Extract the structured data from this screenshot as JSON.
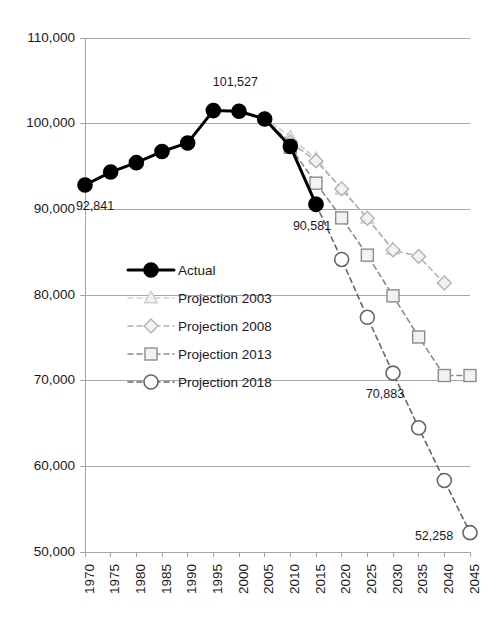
{
  "chart_data": {
    "type": "line",
    "title": "",
    "subtitle": "",
    "xlabel": "",
    "ylabel": "",
    "xlim": [
      1970,
      2045
    ],
    "ylim": [
      50000,
      110000
    ],
    "ytick_step": 10000,
    "xtick_step": 5,
    "grid": true,
    "grid_axis": "y",
    "legend_position": "inside-left",
    "xticks": [
      1970,
      1975,
      1980,
      1985,
      1990,
      1995,
      2000,
      2005,
      2010,
      2015,
      2020,
      2025,
      2030,
      2035,
      2040,
      2045
    ],
    "xtick_labels": [
      "1970",
      "1975",
      "1980",
      "1985",
      "1990",
      "1995",
      "2000",
      "2005",
      "2010",
      "2015",
      "2020",
      "2025",
      "2030",
      "2035",
      "2040",
      "2045"
    ],
    "yticks": [
      50000,
      60000,
      70000,
      80000,
      90000,
      100000,
      110000
    ],
    "ytick_labels": [
      "50,000",
      "60,000",
      "70,000",
      "80,000",
      "90,000",
      "100,000",
      "110,000"
    ],
    "series": [
      {
        "name": "Actual",
        "marker": "circle-filled",
        "line": "solid",
        "color": "#000000",
        "marker_fill": "#000000",
        "line_width": 3,
        "marker_size": 7,
        "x": [
          1970,
          1975,
          1980,
          1985,
          1990,
          1995,
          2000,
          2005,
          2010,
          2015
        ],
        "values": [
          92841,
          94350,
          95450,
          96750,
          97750,
          101527,
          101450,
          100550,
          97350,
          90581
        ]
      },
      {
        "name": "Projection 2003",
        "marker": "triangle-open",
        "line": "dashed",
        "color": "#cfcfcf",
        "marker_fill": "#f2f2f2",
        "line_width": 1.6,
        "marker_size": 6,
        "x": [
          2000,
          2005,
          2010,
          2015,
          2020,
          2025,
          2030
        ],
        "values": [
          101527,
          100700,
          98450,
          95900,
          92350,
          88950,
          85350
        ]
      },
      {
        "name": "Projection 2008",
        "marker": "diamond-open",
        "line": "dashed",
        "color": "#b3b3b3",
        "marker_fill": "#f2f2f2",
        "line_width": 1.6,
        "marker_size": 6,
        "x": [
          2005,
          2010,
          2015,
          2020,
          2025,
          2030,
          2035,
          2040
        ],
        "values": [
          100550,
          97850,
          95650,
          92400,
          88950,
          85250,
          84500,
          81400
        ]
      },
      {
        "name": "Projection 2013",
        "marker": "square-open",
        "line": "dashed",
        "color": "#8c8c8c",
        "marker_fill": "#f2f2f2",
        "line_width": 1.6,
        "marker_size": 6,
        "x": [
          2010,
          2015,
          2020,
          2025,
          2030,
          2035,
          2040,
          2045
        ],
        "values": [
          97250,
          93050,
          89000,
          84650,
          79900,
          75100,
          70600,
          70600
        ]
      },
      {
        "name": "Projection 2018",
        "marker": "circle-open",
        "line": "dashed",
        "color": "#666666",
        "marker_fill": "#ffffff",
        "line_width": 1.6,
        "marker_size": 7,
        "x": [
          2015,
          2020,
          2025,
          2030,
          2035,
          2040,
          2045
        ],
        "values": [
          90581,
          84150,
          77400,
          70883,
          64500,
          58350,
          52258
        ]
      }
    ],
    "annotations": [
      {
        "text": "92,841",
        "x": 1970,
        "y": 92841,
        "dx": 10,
        "dy": 22
      },
      {
        "text": "101,527",
        "x": 1995,
        "y": 101527,
        "dx": 22,
        "dy": -28
      },
      {
        "text": "90,581",
        "x": 2015,
        "y": 90581,
        "dx": -4,
        "dy": 22
      },
      {
        "text": "70,883",
        "x": 2030,
        "y": 70883,
        "dx": -8,
        "dy": 22
      },
      {
        "text": "52,258",
        "x": 2045,
        "y": 52258,
        "dx": -36,
        "dy": 4
      }
    ]
  },
  "legend": {
    "entries": [
      {
        "label": "Actual"
      },
      {
        "label": "Projection 2003"
      },
      {
        "label": "Projection 2008"
      },
      {
        "label": "Projection 2013"
      },
      {
        "label": "Projection 2018"
      }
    ]
  }
}
